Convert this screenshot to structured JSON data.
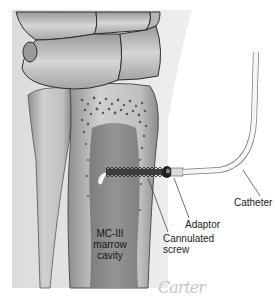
{
  "figure": {
    "labels": {
      "marrow_line1": "MC-III",
      "marrow_line2": "marrow",
      "marrow_line3": "cavity",
      "catheter": "Catheter",
      "adaptor": "Adaptor",
      "screw_line1": "Cannulated",
      "screw_line2": "screw"
    },
    "signature": "Carter",
    "colors": {
      "background": "#ffffff",
      "shading_panel": "#e6e6e6",
      "bone_light": "#cfcfcf",
      "bone_mid": "#a9a9a9",
      "marrow": "#8a8a8a",
      "outline": "#3a3a3a",
      "catheter": "#f2f2f2"
    }
  }
}
